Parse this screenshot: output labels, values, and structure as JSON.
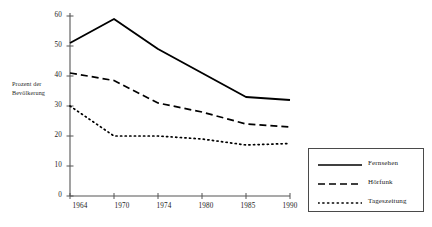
{
  "chart_data": {
    "type": "line",
    "title": "",
    "subtitle": "",
    "xlabel": "",
    "ylabel": "Prozent der Bevölkerung",
    "ylabel_lines": [
      "Prozent der",
      "Bevölkerung"
    ],
    "categories": [
      "1964",
      "1970",
      "1974",
      "1980",
      "1985",
      "1990"
    ],
    "x_tick_labels": [
      "1964",
      "1970",
      "1974",
      "1980",
      "1985",
      "1990"
    ],
    "y_tick_labels": [
      "0",
      "10",
      "20",
      "30",
      "40",
      "50",
      "60"
    ],
    "y_ticks": [
      0,
      10,
      20,
      30,
      40,
      50,
      60
    ],
    "ylim": [
      0,
      60
    ],
    "grid": false,
    "legend_position": "right-bottom-outside",
    "series": [
      {
        "name": "Fernsehen",
        "style": "solid",
        "color": "#000000",
        "values": [
          51,
          59,
          49,
          41,
          33,
          32
        ]
      },
      {
        "name": "Hörfunk",
        "style": "dashed",
        "color": "#000000",
        "values": [
          41,
          38.5,
          31,
          28,
          24,
          23
        ]
      },
      {
        "name": "Tageszeitung",
        "style": "dotted",
        "color": "#000000",
        "values": [
          30,
          20,
          20,
          19,
          17,
          17.5
        ]
      }
    ]
  },
  "legend": {
    "items": [
      {
        "label": "Fernsehen",
        "style": "solid"
      },
      {
        "label": "Hörfunk",
        "style": "dashed"
      },
      {
        "label": "Tageszeitung",
        "style": "dotted"
      }
    ]
  },
  "axes": {
    "y_title_line1": "Prozent der",
    "y_title_line2": "Bevölkerung",
    "y_labels": [
      "60",
      "50",
      "40",
      "30",
      "20",
      "10",
      "0"
    ],
    "x_labels": [
      "1964",
      "1970",
      "1974",
      "1980",
      "1985",
      "1990"
    ]
  },
  "colors": {
    "ink": "#000000",
    "axis": "#555555",
    "background": "#ffffff",
    "legend_border": "#4a4a4a"
  }
}
